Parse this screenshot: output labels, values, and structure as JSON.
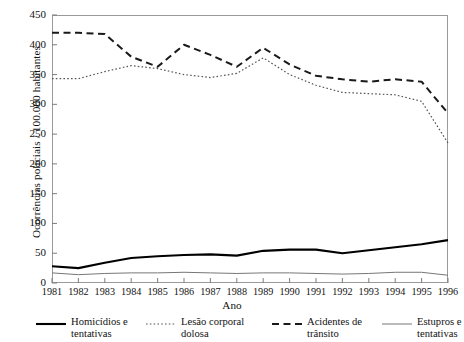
{
  "chart_data": {
    "type": "line",
    "title": "",
    "xlabel": "Ano",
    "ylabel": "Ocorrências policiais / 100.000 habitantes",
    "x": [
      1981,
      1982,
      1983,
      1984,
      1985,
      1986,
      1987,
      1988,
      1989,
      1990,
      1991,
      1992,
      1993,
      1994,
      1995,
      1996
    ],
    "categories": [
      "1981",
      "1982",
      "1983",
      "1984",
      "1985",
      "1986",
      "1987",
      "1988",
      "1989",
      "1990",
      "1991",
      "1992",
      "1993",
      "1994",
      "1995",
      "1996"
    ],
    "xlim": [
      1981,
      1996
    ],
    "ylim": [
      0,
      450
    ],
    "yticks": [
      0,
      50,
      100,
      150,
      200,
      250,
      300,
      350,
      400,
      450
    ],
    "grid": false,
    "legend_position": "bottom",
    "series": [
      {
        "name": "Homicídios e tentativas",
        "style": "solid-thick",
        "color": "#000000",
        "values": [
          28,
          25,
          34,
          42,
          45,
          47,
          48,
          46,
          54,
          56,
          56,
          50,
          55,
          60,
          65,
          72
        ]
      },
      {
        "name": "Lesão corporal dolosa",
        "style": "dotted",
        "color": "#555555",
        "values": [
          343,
          343,
          355,
          365,
          360,
          350,
          345,
          352,
          378,
          350,
          332,
          320,
          318,
          316,
          305,
          235
        ]
      },
      {
        "name": "Acidentes de trânsito",
        "style": "dashed",
        "color": "#1a1a1a",
        "values": [
          420,
          420,
          418,
          380,
          363,
          400,
          383,
          363,
          395,
          367,
          348,
          342,
          338,
          342,
          338,
          285
        ]
      },
      {
        "name": "Estupros e tentativas",
        "style": "solid-thin",
        "color": "#777777",
        "values": [
          17,
          14,
          16,
          17,
          17,
          18,
          17,
          16,
          17,
          17,
          16,
          15,
          16,
          18,
          18,
          13
        ]
      }
    ]
  },
  "axes": {
    "y_title": "Ocorrências policiais / 100.000 habitantes",
    "x_title": "Ano",
    "y_tick_labels": [
      "450",
      "400",
      "350",
      "300",
      "250",
      "200",
      "150",
      "100",
      "50",
      "0"
    ],
    "x_tick_labels": [
      "1981",
      "1982",
      "1983",
      "1984",
      "1985",
      "1986",
      "1987",
      "1988",
      "1989",
      "1990",
      "1991",
      "1992",
      "1993",
      "1994",
      "1995",
      "1996"
    ]
  },
  "legend": {
    "items": [
      {
        "label": "Homicídios e\ntentativas",
        "style": "solid-thick"
      },
      {
        "label": "Lesão corporal\ndolosa",
        "style": "dotted"
      },
      {
        "label": "Acidentes de\ntrânsito",
        "style": "dashed"
      },
      {
        "label": "Estupros e\ntentativas",
        "style": "solid-thin"
      }
    ]
  }
}
